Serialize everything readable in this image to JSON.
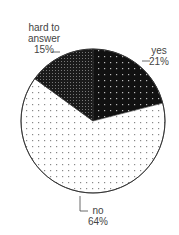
{
  "chart_data": {
    "type": "pie",
    "title": "",
    "categories": [
      "yes",
      "no",
      "hard to answer"
    ],
    "values": [
      21,
      64,
      15
    ],
    "unit": "%",
    "start_angle": "12 o'clock",
    "direction": "clockwise",
    "fills": {
      "yes": "black with sparse white dots",
      "no": "white with sparse gray dots",
      "hard to answer": "black with dense gray dot pattern"
    },
    "labels": [
      {
        "category": "yes",
        "text": "yes",
        "value_text": "21%"
      },
      {
        "category": "no",
        "text": "no",
        "value_text": "64%"
      },
      {
        "category": "hard to answer",
        "text": "hard to answer",
        "value_text": "15%"
      }
    ],
    "legend": "none (direct labels with leader lines)"
  },
  "labels": {
    "yes": {
      "line1": "yes",
      "line2": "21%"
    },
    "no": {
      "line1": "no",
      "line2": "64%"
    },
    "hard": {
      "line1": "hard to",
      "line2": "answer",
      "line3": "15%"
    }
  }
}
